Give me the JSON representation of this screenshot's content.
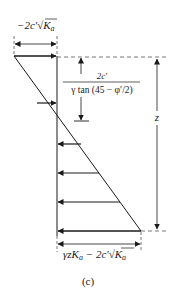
{
  "figure": {
    "caption": "(c)",
    "top_label": {
      "prefix": "−2c′",
      "radical": "√",
      "var": "K",
      "sub": "a"
    },
    "fraction": {
      "numerator": "2c′",
      "denominator": "γ tan (45 − φ′/2)"
    },
    "depth_label": "z",
    "bottom_label": {
      "part1": "γzK",
      "sub1": "a",
      "minus": " − 2c′",
      "radical": "√",
      "var": "K",
      "sub2": "a"
    },
    "colors": {
      "line": "#1a1a1a",
      "dashed": "#555555"
    },
    "pressure_arrows": {
      "tension": [
        {
          "y": 56,
          "x_start": 14
        },
        {
          "y": 103,
          "x_start": 37
        }
      ],
      "compression": [
        {
          "y": 168,
          "x_end": 96
        },
        {
          "y": 199,
          "x_end": 118
        },
        {
          "y": 231,
          "x_end": 141
        }
      ]
    }
  }
}
